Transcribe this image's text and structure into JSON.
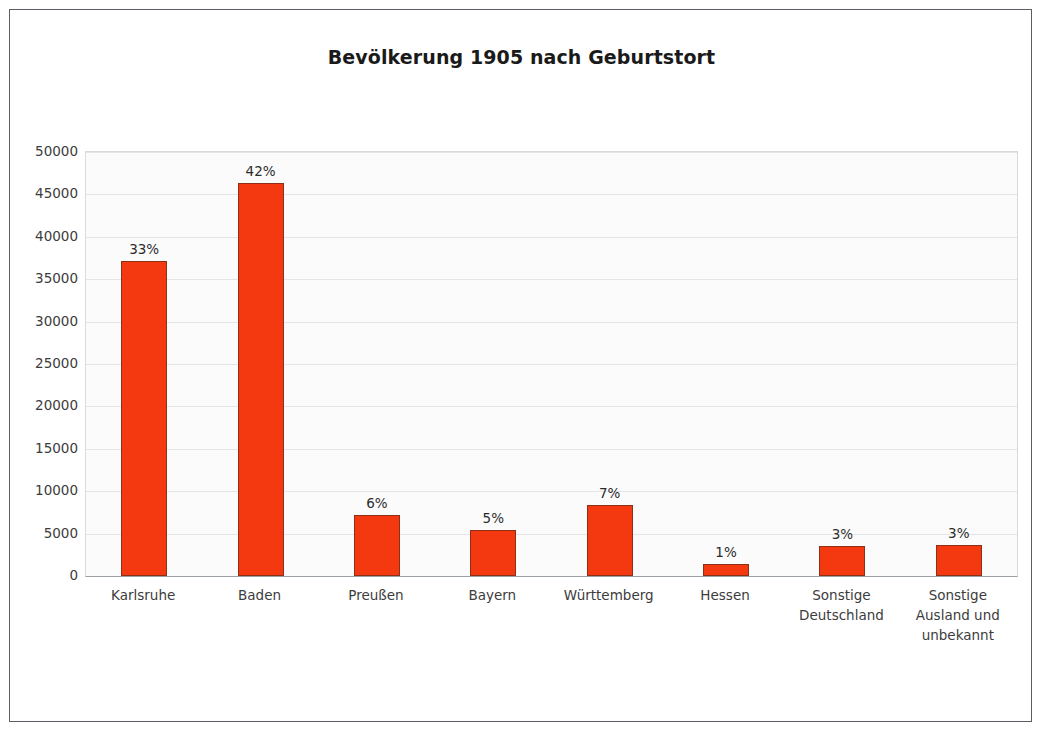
{
  "chart_data": {
    "type": "bar",
    "title": "Bevölkerung 1905 nach Geburtstort",
    "xlabel": "",
    "ylabel": "",
    "ylim": [
      0,
      50000
    ],
    "grid": true,
    "legend": "none",
    "yticks": [
      "50000",
      "45000",
      "40000",
      "35000",
      "30000",
      "25000",
      "20000",
      "15000",
      "10000",
      "5000",
      "0"
    ],
    "ytick_values": [
      50000,
      45000,
      40000,
      35000,
      30000,
      25000,
      20000,
      15000,
      10000,
      5000,
      0
    ],
    "categories": [
      "Karlsruhe",
      "Baden",
      "Preußen",
      "Bayern",
      "Württemberg",
      "Hessen",
      "Sonstige Deutschland",
      "Sonstige Ausland und unbekannt"
    ],
    "category_lines": [
      [
        "Karlsruhe"
      ],
      [
        "Baden"
      ],
      [
        "Preußen"
      ],
      [
        "Bayern"
      ],
      [
        "Württemberg"
      ],
      [
        "Hessen"
      ],
      [
        "Sonstige",
        "Deutschland"
      ],
      [
        "Sonstige",
        "Ausland und",
        "unbekannt"
      ]
    ],
    "values": [
      37200,
      46300,
      7200,
      5400,
      8400,
      1400,
      3500,
      3700
    ],
    "data_labels": [
      "33%",
      "42%",
      "6%",
      "5%",
      "7%",
      "1%",
      "3%",
      "3%"
    ],
    "percentages": [
      33,
      42,
      6,
      5,
      7,
      1,
      3,
      3
    ],
    "series": [
      {
        "name": "Bevölkerung 1905",
        "values": [
          37200,
          46300,
          7200,
          5400,
          8400,
          1400,
          3500,
          3700
        ]
      }
    ],
    "colors": {
      "bar_fill": "#f4380f",
      "bar_border": "#8d3018",
      "plot_background": "#fbfbfc",
      "gridline": "#e3e5e9",
      "axis_line": "#9aa0a6",
      "text": "#3c3c3c",
      "frame_border": "#5a5f66"
    }
  }
}
